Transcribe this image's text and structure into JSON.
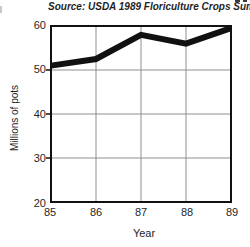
{
  "header": {
    "source_note": "Source: USDA 1989 Floriculture Crops Summary"
  },
  "chart_data": {
    "type": "line",
    "x": [
      85,
      86,
      87,
      88,
      89
    ],
    "x_labels": [
      "85",
      "86",
      "87",
      "88",
      "89"
    ],
    "values": [
      51,
      52.5,
      58,
      56,
      59.5
    ],
    "xlabel": "Year",
    "ylabel": "Millions of pots",
    "ylim": [
      20,
      60
    ],
    "yticks": [
      60,
      50,
      40,
      30,
      20
    ],
    "ytick_labels": [
      "60",
      "50",
      "40",
      "30",
      "20"
    ],
    "grid": "on",
    "legend": "none",
    "line_width": 6,
    "line_color": "#111111",
    "grid_color": "#8f8f8f",
    "frame_color": "#111111"
  }
}
